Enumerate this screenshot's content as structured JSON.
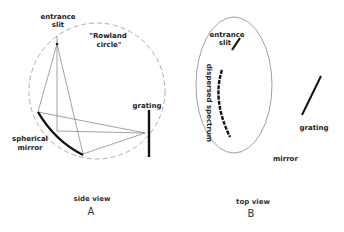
{
  "panel_a": {
    "caption": "side view",
    "letter": "A",
    "labels": {
      "entrance_slit_line1": "entrance",
      "entrance_slit_line2": "slit",
      "rowland_line1": "\"Rowland",
      "rowland_line2": "circle\"",
      "grating": "grating",
      "mirror_line1": "spherical",
      "mirror_line2": "mirror"
    }
  },
  "panel_b": {
    "caption": "top view",
    "letter": "B",
    "labels": {
      "entrance_slit_line1": "entrance",
      "entrance_slit_line2": "slit",
      "spectrum": "dispersed spectrum",
      "mirror": "mirror",
      "grating": "grating"
    }
  },
  "colors": {
    "line": "#111111",
    "thin_line": "#777777",
    "dashed_circle": "#999999",
    "background": "#ffffff"
  }
}
